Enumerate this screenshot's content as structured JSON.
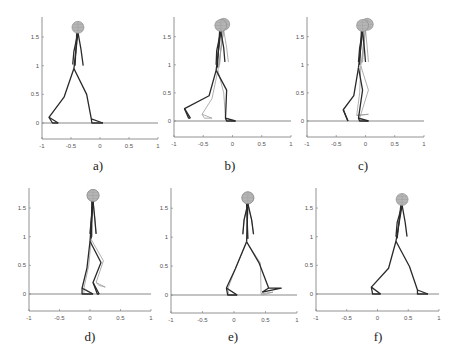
{
  "figure": {
    "panel_labels": [
      "a)",
      "b)",
      "c)",
      "d)",
      "e)",
      "f)"
    ],
    "x_ticks": [
      "-1",
      "-0.5",
      "0",
      "0.5",
      "1"
    ],
    "y_ticks": [
      "0",
      "0.5",
      "1",
      "1.5"
    ]
  },
  "chart_data": [
    {
      "type": "line",
      "label": "a)",
      "title": "",
      "xlabel": "",
      "ylabel": "",
      "xlim": [
        -1,
        1
      ],
      "ylim": [
        -0.3,
        1.85
      ],
      "xticks": [
        -1,
        -0.5,
        0,
        0.5,
        1
      ],
      "yticks": [
        0,
        0.5,
        1,
        1.5
      ],
      "grid": false,
      "ground_y": 0,
      "poses": [
        {
          "style": "dark",
          "head": [
            -0.38,
            1.67
          ],
          "neck": [
            -0.38,
            1.58
          ],
          "hip": [
            -0.45,
            0.95
          ],
          "arm_a": [
            [
              -0.38,
              1.58
            ],
            [
              -0.45,
              1.25
            ],
            [
              -0.47,
              1.02
            ]
          ],
          "arm_b": [
            [
              -0.38,
              1.58
            ],
            [
              -0.33,
              1.3
            ],
            [
              -0.29,
              1.0
            ]
          ],
          "leg_back": [
            [
              -0.45,
              0.95
            ],
            [
              -0.62,
              0.45
            ],
            [
              -0.88,
              0.1
            ],
            [
              -0.82,
              0.0
            ],
            [
              -0.72,
              0.0
            ]
          ],
          "leg_front": [
            [
              -0.45,
              0.95
            ],
            [
              -0.23,
              0.5
            ],
            [
              -0.15,
              0.07
            ],
            [
              -0.14,
              0.0
            ],
            [
              0.05,
              0.0
            ]
          ]
        }
      ]
    },
    {
      "type": "line",
      "label": "b)",
      "xlim": [
        -1,
        1
      ],
      "ylim": [
        -0.3,
        1.85
      ],
      "xticks": [
        -1,
        -0.5,
        0,
        0.5,
        1
      ],
      "yticks": [
        0,
        0.5,
        1,
        1.5
      ],
      "grid": false,
      "ground_y": 0,
      "poses": [
        {
          "style": "dark",
          "head": [
            -0.2,
            1.7
          ],
          "neck": [
            -0.2,
            1.6
          ],
          "hip": [
            -0.28,
            0.9
          ],
          "arm_a": [
            [
              -0.2,
              1.6
            ],
            [
              -0.27,
              1.25
            ],
            [
              -0.28,
              1.0
            ]
          ],
          "arm_b": [
            [
              -0.2,
              1.6
            ],
            [
              -0.15,
              1.3
            ],
            [
              -0.13,
              1.05
            ]
          ],
          "leg_back": [
            [
              -0.28,
              0.9
            ],
            [
              -0.4,
              0.45
            ],
            [
              -0.82,
              0.22
            ],
            [
              -0.75,
              0.05
            ],
            [
              -0.72,
              0.05
            ]
          ],
          "leg_front": [
            [
              -0.28,
              0.9
            ],
            [
              -0.1,
              0.55
            ],
            [
              -0.12,
              0.05
            ],
            [
              -0.1,
              0.0
            ],
            [
              0.05,
              0.0
            ]
          ]
        },
        {
          "style": "light",
          "head": [
            -0.15,
            1.72
          ],
          "neck": [
            -0.15,
            1.62
          ],
          "hip": [
            -0.25,
            0.9
          ],
          "arm_a": [
            [
              -0.15,
              1.62
            ],
            [
              -0.2,
              1.25
            ],
            [
              -0.22,
              1.0
            ]
          ],
          "arm_b": [
            [
              -0.15,
              1.62
            ],
            [
              -0.1,
              1.3
            ],
            [
              -0.07,
              1.05
            ]
          ],
          "leg_back": [
            [
              -0.25,
              0.9
            ],
            [
              -0.35,
              0.4
            ],
            [
              -0.52,
              0.12
            ],
            [
              -0.48,
              0.05
            ],
            [
              -0.35,
              0.05
            ]
          ],
          "leg_front": [
            [
              -0.25,
              0.9
            ],
            [
              -0.15,
              0.5
            ],
            [
              -0.12,
              0.05
            ],
            [
              -0.1,
              0.0
            ],
            [
              0.05,
              0.0
            ]
          ]
        }
      ]
    },
    {
      "type": "line",
      "label": "c)",
      "xlim": [
        -1,
        1
      ],
      "ylim": [
        -0.3,
        1.85
      ],
      "xticks": [
        -1,
        -0.5,
        0,
        0.5,
        1
      ],
      "yticks": [
        0,
        0.5,
        1,
        1.5
      ],
      "grid": false,
      "ground_y": 0,
      "poses": [
        {
          "style": "dark",
          "head": [
            -0.05,
            1.7
          ],
          "neck": [
            -0.05,
            1.6
          ],
          "hip": [
            -0.12,
            0.95
          ],
          "arm_a": [
            [
              -0.05,
              1.6
            ],
            [
              -0.1,
              1.3
            ],
            [
              -0.12,
              1.05
            ]
          ],
          "arm_b": [
            [
              -0.05,
              1.6
            ],
            [
              -0.02,
              1.3
            ],
            [
              0.0,
              1.05
            ]
          ],
          "leg_back": [
            [
              -0.12,
              0.95
            ],
            [
              -0.2,
              0.45
            ],
            [
              -0.38,
              0.2
            ],
            [
              -0.32,
              0.05
            ],
            [
              -0.3,
              0.0
            ]
          ],
          "leg_front": [
            [
              -0.12,
              0.95
            ],
            [
              -0.05,
              0.55
            ],
            [
              -0.12,
              0.05
            ],
            [
              -0.1,
              0.0
            ],
            [
              0.05,
              0.0
            ]
          ]
        },
        {
          "style": "light",
          "head": [
            0.03,
            1.72
          ],
          "neck": [
            0.0,
            1.62
          ],
          "hip": [
            -0.08,
            0.98
          ],
          "arm_a": [
            [
              0.0,
              1.62
            ],
            [
              -0.03,
              1.3
            ],
            [
              -0.05,
              1.05
            ]
          ],
          "arm_b": [
            [
              0.0,
              1.62
            ],
            [
              0.03,
              1.3
            ],
            [
              0.05,
              1.05
            ]
          ],
          "leg_back": [
            [
              -0.08,
              0.98
            ],
            [
              -0.1,
              0.5
            ],
            [
              -0.15,
              0.1
            ],
            [
              -0.12,
              0.1
            ],
            [
              0.05,
              0.12
            ]
          ],
          "leg_front": [
            [
              -0.08,
              0.98
            ],
            [
              0.05,
              0.55
            ],
            [
              -0.1,
              0.05
            ],
            [
              -0.08,
              0.0
            ],
            [
              0.05,
              0.0
            ]
          ]
        }
      ]
    },
    {
      "type": "line",
      "label": "d)",
      "xlim": [
        -1,
        1
      ],
      "ylim": [
        -0.3,
        1.85
      ],
      "xticks": [
        -1,
        -0.5,
        0,
        0.5,
        1
      ],
      "yticks": [
        0,
        0.5,
        1,
        1.5
      ],
      "grid": false,
      "ground_y": 0,
      "poses": [
        {
          "style": "dark",
          "head": [
            0.05,
            1.72
          ],
          "neck": [
            0.05,
            1.62
          ],
          "hip": [
            0.0,
            0.92
          ],
          "arm_a": [
            [
              0.05,
              1.62
            ],
            [
              0.02,
              1.3
            ],
            [
              0.0,
              1.05
            ]
          ],
          "arm_b": [
            [
              0.05,
              1.62
            ],
            [
              0.08,
              1.3
            ],
            [
              0.1,
              1.05
            ]
          ],
          "leg_back": [
            [
              0.0,
              0.92
            ],
            [
              -0.05,
              0.45
            ],
            [
              -0.13,
              0.1
            ],
            [
              -0.13,
              0.0
            ],
            [
              0.05,
              0.0
            ]
          ],
          "leg_front": [
            [
              0.0,
              0.92
            ],
            [
              0.18,
              0.55
            ],
            [
              0.05,
              0.2
            ],
            [
              0.12,
              0.0
            ],
            [
              0.15,
              0.0
            ]
          ]
        },
        {
          "style": "light",
          "head": [
            0.05,
            1.72
          ],
          "neck": [
            0.05,
            1.62
          ],
          "hip": [
            0.02,
            0.95
          ],
          "arm_a": [
            [
              0.05,
              1.62
            ],
            [
              0.02,
              1.3
            ],
            [
              0.0,
              1.05
            ]
          ],
          "arm_b": [
            [
              0.05,
              1.62
            ],
            [
              0.08,
              1.3
            ],
            [
              0.1,
              1.05
            ]
          ],
          "leg_back": [
            [
              0.02,
              0.95
            ],
            [
              -0.02,
              0.5
            ],
            [
              -0.1,
              0.1
            ],
            [
              -0.1,
              0.0
            ],
            [
              0.05,
              0.0
            ]
          ],
          "leg_front": [
            [
              0.02,
              0.95
            ],
            [
              0.22,
              0.58
            ],
            [
              0.1,
              0.2
            ],
            [
              0.15,
              0.15
            ],
            [
              0.25,
              0.12
            ]
          ]
        }
      ]
    },
    {
      "type": "line",
      "label": "e)",
      "xlim": [
        -1,
        1
      ],
      "ylim": [
        -0.3,
        1.85
      ],
      "xticks": [
        -1,
        -0.5,
        0,
        0.5,
        1
      ],
      "yticks": [
        0,
        0.5,
        1,
        1.5
      ],
      "grid": false,
      "ground_y": 0,
      "poses": [
        {
          "style": "dark",
          "head": [
            0.22,
            1.68
          ],
          "neck": [
            0.22,
            1.58
          ],
          "hip": [
            0.2,
            0.92
          ],
          "arm_a": [
            [
              0.22,
              1.58
            ],
            [
              0.16,
              1.3
            ],
            [
              0.14,
              1.05
            ]
          ],
          "arm_b": [
            [
              0.22,
              1.58
            ],
            [
              0.28,
              1.3
            ],
            [
              0.31,
              1.05
            ]
          ],
          "leg_back": [
            [
              0.2,
              0.92
            ],
            [
              0.02,
              0.45
            ],
            [
              -0.12,
              0.12
            ],
            [
              -0.1,
              0.0
            ],
            [
              0.05,
              0.0
            ]
          ],
          "leg_front": [
            [
              0.2,
              0.92
            ],
            [
              0.4,
              0.55
            ],
            [
              0.55,
              0.12
            ],
            [
              0.75,
              0.12
            ],
            [
              0.45,
              0.05
            ]
          ]
        },
        {
          "style": "light",
          "head": [
            0.22,
            1.68
          ],
          "neck": [
            0.22,
            1.58
          ],
          "hip": [
            0.2,
            0.92
          ],
          "arm_a": [
            [
              0.22,
              1.58
            ],
            [
              0.16,
              1.3
            ],
            [
              0.14,
              1.05
            ]
          ],
          "arm_b": [
            [
              0.22,
              1.58
            ],
            [
              0.28,
              1.3
            ],
            [
              0.31,
              1.05
            ]
          ],
          "leg_back": [
            [
              0.2,
              0.92
            ],
            [
              0.02,
              0.45
            ],
            [
              -0.1,
              0.1
            ],
            [
              -0.08,
              0.0
            ],
            [
              0.05,
              0.0
            ]
          ],
          "leg_front": [
            [
              0.2,
              0.92
            ],
            [
              0.42,
              0.55
            ],
            [
              0.43,
              0.02
            ],
            [
              0.45,
              0.0
            ],
            [
              0.62,
              0.05
            ]
          ]
        }
      ]
    },
    {
      "type": "line",
      "label": "f)",
      "xlim": [
        -1,
        1
      ],
      "ylim": [
        -0.3,
        1.85
      ],
      "xticks": [
        -1,
        -0.5,
        0,
        0.5,
        1
      ],
      "yticks": [
        0,
        0.5,
        1,
        1.5
      ],
      "grid": false,
      "ground_y": 0,
      "poses": [
        {
          "style": "dark",
          "head": [
            0.4,
            1.65
          ],
          "neck": [
            0.4,
            1.55
          ],
          "hip": [
            0.3,
            0.92
          ],
          "arm_a": [
            [
              0.4,
              1.55
            ],
            [
              0.32,
              1.25
            ],
            [
              0.3,
              1.0
            ]
          ],
          "arm_b": [
            [
              0.4,
              1.55
            ],
            [
              0.45,
              1.25
            ],
            [
              0.48,
              1.0
            ]
          ],
          "leg_back": [
            [
              0.3,
              0.92
            ],
            [
              0.18,
              0.45
            ],
            [
              -0.1,
              0.12
            ],
            [
              -0.08,
              0.0
            ],
            [
              0.05,
              0.0
            ]
          ],
          "leg_front": [
            [
              0.3,
              0.92
            ],
            [
              0.52,
              0.48
            ],
            [
              0.65,
              0.07
            ],
            [
              0.65,
              0.0
            ],
            [
              0.82,
              0.0
            ]
          ]
        }
      ]
    }
  ]
}
